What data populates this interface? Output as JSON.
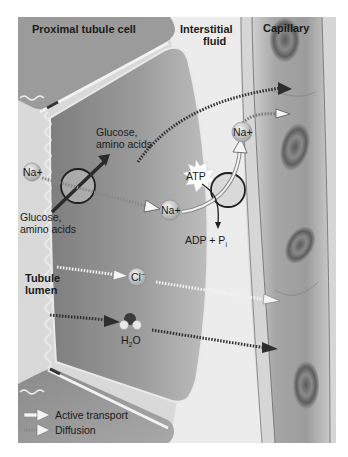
{
  "title_labels": {
    "proximal_cell": "Proximal tubule cell",
    "interstitial_line1": "Interstitial",
    "interstitial_line2": "fluid",
    "capillary": "Capillary",
    "lumen_line1": "Tubule",
    "lumen_line2": "lumen"
  },
  "molecules": {
    "glucose_in_line1": "Glucose,",
    "glucose_in_line2": "amino acids",
    "glucose_out_line1": "Glucose,",
    "glucose_out_line2": "amino acids",
    "na_lumen": "Na+",
    "na_cell": "Na+",
    "na_interstitial": "Na+",
    "atp": "ATP",
    "adp": "ADP + P",
    "adp_sub": "i",
    "cl": "Cl",
    "cl_sup": "−",
    "h2o_h": "H",
    "h2o_sub": "2",
    "h2o_o": "O"
  },
  "legend": {
    "active": "Active transport",
    "diffusion": "Diffusion"
  },
  "colors": {
    "cell": "#8f8f8f",
    "cell_light": "#b5b5b5",
    "lumen": "#dcdcdc",
    "interstitial": "#e8e8e8",
    "capillary": "#a9a9a9",
    "rbc": "#6e6e6e",
    "arrow_dark": "#333333",
    "arrow_light": "#f2f2f2"
  }
}
